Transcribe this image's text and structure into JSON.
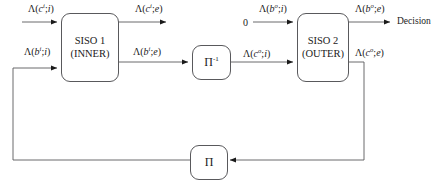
{
  "diagram": {
    "blocks": {
      "siso1": {
        "name": "siso-1",
        "line1": "SISO 1",
        "line2": "(INNER)"
      },
      "siso2": {
        "name": "siso-2",
        "line1": "SISO 2",
        "line2": "(OUTER)"
      },
      "deinterleaver": {
        "name": "deinterleaver",
        "symbol": "Π",
        "superscript": "-1"
      },
      "interleaver": {
        "name": "interleaver",
        "symbol": "Π"
      }
    },
    "labels": {
      "lambda": "Λ",
      "ci_i": {
        "var": "c",
        "sup": "i",
        "arg": "i",
        "text": "Λ(cⁱ;i)"
      },
      "bi_i": {
        "var": "b",
        "sup": "i",
        "arg": "i",
        "text": "Λ(bⁱ;i)"
      },
      "ci_e": {
        "var": "c",
        "sup": "i",
        "arg": "e",
        "text": "Λ(cⁱ;e)"
      },
      "bi_e": {
        "var": "b",
        "sup": "i",
        "arg": "e",
        "text": "Λ(bⁱ;e)"
      },
      "bo_i": {
        "var": "b",
        "sup": "o",
        "arg": "i",
        "text": "Λ(bᵒ;i)"
      },
      "co_i": {
        "var": "c",
        "sup": "o",
        "arg": "i",
        "text": "Λ(cᵒ;i)"
      },
      "bo_e": {
        "var": "b",
        "sup": "o",
        "arg": "e",
        "text": "Λ(bᵒ;e)"
      },
      "co_e": {
        "var": "c",
        "sup": "o",
        "arg": "e",
        "text": "Λ(cᵒ;e)"
      },
      "zero": "0",
      "decision": "Decision"
    },
    "colors": {
      "line": "#59595c",
      "text": "#1a1a1a",
      "background": "#ffffff"
    }
  }
}
